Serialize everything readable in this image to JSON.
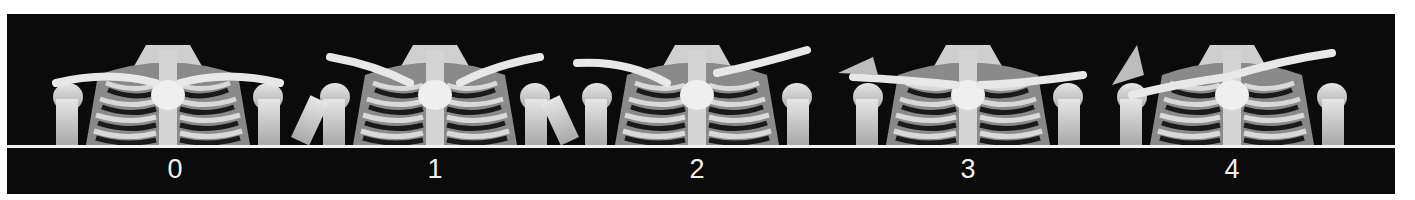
{
  "figure": {
    "background_color": "#0b0b0b",
    "separator_color": "#f2f2f2",
    "label_color": "#f0f0f0",
    "panels": [
      {
        "label": "0",
        "center_x": 168,
        "subject": "3D CT rendering of thorax, clavicles and shoulders"
      },
      {
        "label": "1",
        "center_x": 428,
        "subject": "3D CT rendering of thorax, clavicles and shoulders"
      },
      {
        "label": "2",
        "center_x": 690,
        "subject": "3D CT rendering of thorax, clavicles and shoulders"
      },
      {
        "label": "3",
        "center_x": 961,
        "subject": "3D CT rendering of thorax, clavicles and shoulders"
      },
      {
        "label": "4",
        "center_x": 1225,
        "subject": "3D CT rendering of thorax, clavicles and shoulders"
      }
    ]
  }
}
